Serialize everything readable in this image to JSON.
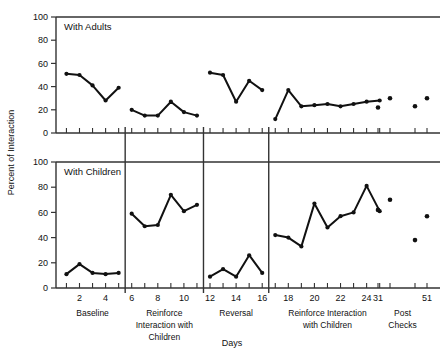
{
  "figure": {
    "ylabel": "Percent of Interaction",
    "xlabel": "Days",
    "panel_top_label": "With Adults",
    "panel_bottom_label": "With Children"
  },
  "axes": {
    "y_ticks": [
      0,
      20,
      40,
      60,
      80,
      100
    ],
    "y_tick_labels": [
      "0",
      "20",
      "40",
      "60",
      "80",
      "100"
    ],
    "x_tick_labels": [
      "2",
      "4",
      "6",
      "8",
      "10",
      "12",
      "14",
      "16",
      "18",
      "20",
      "22",
      "24",
      "31",
      "51"
    ],
    "x_tick_values": [
      2,
      4,
      6,
      8,
      10,
      12,
      14,
      16,
      18,
      20,
      22,
      24,
      31,
      51
    ],
    "ylim": [
      0,
      100
    ],
    "grid": "off",
    "legend": "none"
  },
  "phases": [
    {
      "label": "Baseline",
      "lines": [
        "Baseline"
      ],
      "start_day": 1,
      "end_day": 5
    },
    {
      "label": "Reinforce Interaction with Children",
      "lines": [
        "Reinforce",
        "Interaction with",
        "Children"
      ],
      "start_day": 6,
      "end_day": 11
    },
    {
      "label": "Reversal",
      "lines": [
        "Reversal"
      ],
      "start_day": 12,
      "end_day": 16
    },
    {
      "label": "Reinforce Interaction with Children",
      "lines": [
        "Reinforce Interaction",
        "with Children"
      ],
      "start_day": 17,
      "end_day": 25
    },
    {
      "label": "Post Checks",
      "lines": [
        "Post",
        "Checks"
      ],
      "start_day": 31,
      "end_day": 51
    }
  ],
  "chart_data": {
    "type": "line",
    "title": "",
    "subtitle": "",
    "xlabel": "Days",
    "ylabel": "Percent of Interaction",
    "ylim": [
      0,
      100
    ],
    "grid": false,
    "legend_position": "none",
    "panels": [
      {
        "name": "With Adults",
        "ylim": [
          0,
          100
        ],
        "segments": [
          {
            "phase": "Baseline",
            "x": [
              1,
              2,
              3,
              4,
              5
            ],
            "y": [
              51,
              50,
              41,
              28,
              39
            ]
          },
          {
            "phase": "Reinforce Interaction with Children",
            "x": [
              6,
              7,
              8,
              9,
              10,
              11
            ],
            "y": [
              20,
              15,
              15,
              27,
              18,
              15
            ]
          },
          {
            "phase": "Reversal",
            "x": [
              12,
              13,
              14,
              15,
              16
            ],
            "y": [
              52,
              50,
              27,
              45,
              37
            ]
          },
          {
            "phase": "Reinforce Interaction with Children",
            "x": [
              17,
              18,
              19,
              20,
              21,
              22,
              23,
              24,
              25
            ],
            "y": [
              12,
              37,
              23,
              24,
              25,
              23,
              25,
              27,
              28
            ]
          }
        ],
        "points_only": [
          {
            "phase": "Post Checks",
            "x": [
              31,
              33,
              49,
              51
            ],
            "y": [
              22,
              30,
              23,
              30
            ]
          }
        ]
      },
      {
        "name": "With Children",
        "ylim": [
          0,
          100
        ],
        "segments": [
          {
            "phase": "Baseline",
            "x": [
              1,
              2,
              3,
              4,
              5
            ],
            "y": [
              11,
              19,
              12,
              11,
              12
            ]
          },
          {
            "phase": "Reinforce Interaction with Children",
            "x": [
              6,
              7,
              8,
              9,
              10,
              11
            ],
            "y": [
              59,
              49,
              50,
              74,
              61,
              66
            ]
          },
          {
            "phase": "Reversal",
            "x": [
              12,
              13,
              14,
              15,
              16
            ],
            "y": [
              9,
              15,
              9,
              26,
              12
            ]
          },
          {
            "phase": "Reinforce Interaction with Children",
            "x": [
              17,
              18,
              19,
              20,
              21,
              22,
              23,
              24,
              25
            ],
            "y": [
              42,
              40,
              33,
              67,
              48,
              57,
              60,
              81,
              61
            ]
          }
        ],
        "points_only": [
          {
            "phase": "Post Checks",
            "x": [
              31,
              33,
              49,
              51
            ],
            "y": [
              62,
              70,
              38,
              57
            ]
          }
        ]
      }
    ]
  },
  "style": {
    "line_color": "#111111",
    "axis_color": "#333333",
    "background": "#ffffff"
  }
}
